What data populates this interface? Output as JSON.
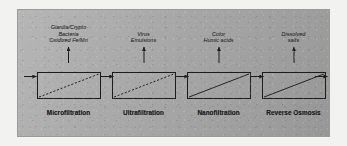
{
  "diagram": {
    "panel_color": "#a8a8a8",
    "line_color": "#1c1c1c",
    "feed_label": "",
    "stages": [
      {
        "process": "Microfiltration",
        "rejected": [
          "Giardia/Crypto",
          "Bacteria",
          "Oxidized Fe/Mn"
        ],
        "membrane_line": "dashed"
      },
      {
        "process": "Ultrafiltration",
        "rejected": [
          "Virus",
          "Emulsions"
        ],
        "membrane_line": "dashed"
      },
      {
        "process": "Nanofiltration",
        "rejected": [
          "Color",
          "Humic acids"
        ],
        "membrane_line": "solid"
      },
      {
        "process": "Reverse Osmosis",
        "rejected": [
          "Dissolved",
          "salts"
        ],
        "membrane_line": "solid"
      }
    ]
  }
}
